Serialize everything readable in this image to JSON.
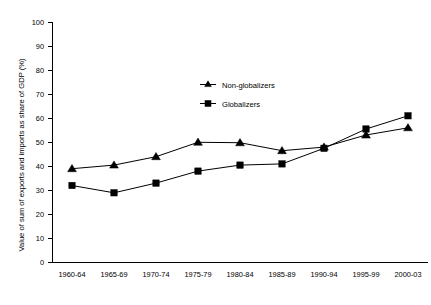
{
  "chart_data": {
    "type": "line",
    "title": "",
    "xlabel": "",
    "ylabel": "Value of sum of exports and imports as share of GDP (%)",
    "categories": [
      "1960-64",
      "1965-69",
      "1970-74",
      "1975-79",
      "1980-84",
      "1985-89",
      "1990-94",
      "1995-99",
      "2000-03"
    ],
    "series": [
      {
        "name": "Non-globalizers",
        "marker": "triangle",
        "color": "#000000",
        "values": [
          39,
          40.5,
          44,
          50,
          49.8,
          46.5,
          48,
          53,
          56
        ]
      },
      {
        "name": "Globalizers",
        "marker": "square",
        "color": "#000000",
        "values": [
          32,
          29,
          33,
          38,
          40.5,
          41,
          47.5,
          55.5,
          61
        ]
      }
    ],
    "ylim": [
      0,
      100
    ],
    "ytick_step": 10,
    "yticks": [
      "0",
      "10",
      "20",
      "30",
      "40",
      "50",
      "60",
      "70",
      "80",
      "90",
      "100"
    ],
    "grid": false,
    "legend_position": "upper-center"
  },
  "legend": {
    "items": [
      {
        "label": "Non-globalizers",
        "marker": "triangle-marker"
      },
      {
        "label": "Globalizers",
        "marker": "square-marker"
      }
    ]
  },
  "colors": {
    "axis": "#000000",
    "series": "#000000",
    "background": "#ffffff"
  }
}
